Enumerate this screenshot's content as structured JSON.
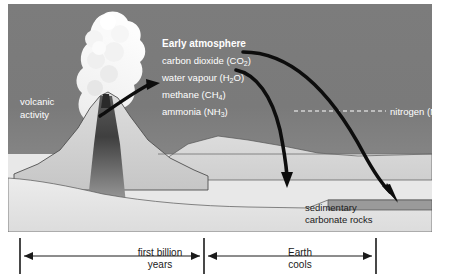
{
  "diagram": {
    "title_hidden": "Early Earth atmosphere formation",
    "scene": {
      "volcano_label_line1": "volcanic",
      "volcano_label_line2": "activity",
      "atmosphere_heading": "Early atmosphere",
      "gases": [
        {
          "name": "carbon dioxide",
          "formula_main": "CO",
          "formula_sub": "2",
          "full": "carbon dioxide (CO2)"
        },
        {
          "name": "water vapour",
          "formula_main": "H",
          "formula_sub": "2",
          "formula_tail": "O",
          "full": "water vapour (H2O)"
        },
        {
          "name": "methane",
          "formula_main": "CH",
          "formula_sub": "4",
          "full": "methane (CH4)"
        },
        {
          "name": "ammonia",
          "formula_main": "NH",
          "formula_sub": "3",
          "full": "ammonia (NH3)"
        }
      ],
      "nitrogen_label": "nitrogen (N",
      "nitrogen_sub": "2",
      "nitrogen_tail": ")",
      "sediment_label_line1": "sedimentary",
      "sediment_label_line2": "carbonate rocks"
    },
    "timeline": {
      "span1_line1": "first billion",
      "span1_line2": "years",
      "span2_line1": "Earth",
      "span2_line2": "cools"
    },
    "colors": {
      "sky": "#7a7a7a",
      "land": "#d2d2d2",
      "water": "#e8e8e8",
      "magma": "#4a4a4a",
      "carbonate_shelf": "#8e8e8e",
      "plume": "#f2f2f2",
      "arrow": "#0d0d0d",
      "label_light": "#ffffff",
      "label_dark": "#1a1a1a",
      "background": "#ffffff"
    }
  }
}
